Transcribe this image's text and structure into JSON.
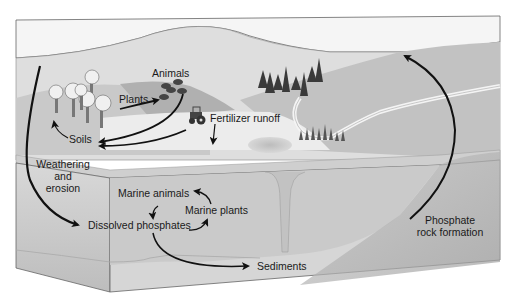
{
  "diagram": {
    "colors": {
      "background": "#ffffff",
      "sky": "#f4f4f4",
      "far_hill": "#dcdcdc",
      "mid_hill": "#c4c4c4",
      "dark_hill": "#a9a9a9",
      "land": "#e6e6e6",
      "ocean": "#cfcfcf",
      "ocean_dark": "#b8b8b8",
      "box_front": "#e2e2e2",
      "outline": "#555555",
      "arrow": "#111111"
    },
    "labels": {
      "animals": "Animals",
      "plants": "Plants",
      "soils": "Soils",
      "fertilizer_runoff": "Fertilizer runoff",
      "weathering_line1": "Weathering",
      "weathering_line2": "and",
      "weathering_line3": "erosion",
      "marine_animals": "Marine animals",
      "marine_plants": "Marine plants",
      "dissolved_phosphates": "Dissolved phosphates",
      "sediments": "Sediments",
      "phosphate_line1": "Phosphate",
      "phosphate_line2": "rock formation"
    },
    "nodes": [
      "Plants",
      "Animals",
      "Soils",
      "Fertilizer runoff",
      "Weathering and erosion",
      "Dissolved phosphates",
      "Marine animals",
      "Marine plants",
      "Sediments",
      "Phosphate rock formation"
    ],
    "edges": [
      {
        "from": "Plants",
        "to": "Animals"
      },
      {
        "from": "Animals",
        "to": "Soils"
      },
      {
        "from": "Fertilizer runoff",
        "to": "Soils"
      },
      {
        "from": "Soils",
        "to": "Plants"
      },
      {
        "from": "Weathering and erosion",
        "to": "Dissolved phosphates"
      },
      {
        "from": "Dissolved phosphates",
        "to": "Marine plants"
      },
      {
        "from": "Marine plants",
        "to": "Marine animals"
      },
      {
        "from": "Marine animals",
        "to": "Dissolved phosphates"
      },
      {
        "from": "Dissolved phosphates",
        "to": "Sediments"
      },
      {
        "from": "Phosphate rock formation",
        "to": "Land"
      }
    ]
  }
}
